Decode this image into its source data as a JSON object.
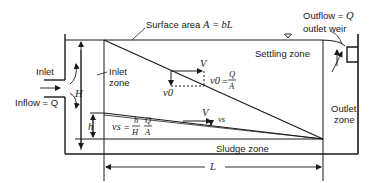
{
  "diagram": {
    "type": "ideal-rectangular-settling-tank",
    "labels": {
      "surface_area": "Surface area A = bL",
      "surface_area_prefix": "Surface area ",
      "surface_area_formula": "A = bL",
      "outflow": "Outflow = Q",
      "outflow_prefix": "Outflow = ",
      "outflow_var": "Q",
      "outlet_weir": "outlet weir",
      "settling_zone": "Settling zone",
      "inlet": "Inlet",
      "inflow": "Inflow = Q",
      "inlet_zone_line1": "Inlet",
      "inlet_zone_line2": "zone",
      "outlet_zone_line1": "Outlet",
      "outlet_zone_line2": "zone",
      "sludge_zone": "Sludge zone",
      "H": "H",
      "h": "h",
      "L": "L",
      "V_upper": "V",
      "V_lower": "V",
      "v0_vertical": "v0",
      "v0_eq_lhs": "v0",
      "v0_eq_num": "Q",
      "v0_eq_den": "A",
      "vs_eq_lhs": "vs",
      "vs_eq_h": "h",
      "vs_eq_H": "H",
      "vs_eq_Q": "Q",
      "vs_eq_A": "A",
      "vs_arrow": "vs",
      "water_surface_symbol": "▽"
    },
    "colors": {
      "line": "#1a1a1a",
      "background": "#ffffff"
    }
  }
}
